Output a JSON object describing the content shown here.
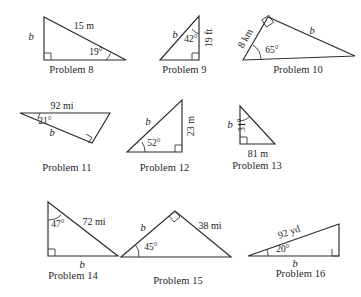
{
  "page": {
    "background_color": "#ffffff",
    "stroke_color": "#2b2b2b",
    "text_color": "#1b1b1b"
  },
  "problems": [
    {
      "id": "problem-8",
      "caption": "Problem 8",
      "unknown_label": "b",
      "side_label": "15 m",
      "angle_label": "19°",
      "has_right_angle": true,
      "right_angle_vertex": "bottom-left",
      "shape": "right triangle, vertical leg at left labeled b, hypotenuse 15 m sloping down to the right, 19 degree angle at the far right vertex"
    },
    {
      "id": "problem-9",
      "caption": "Problem 9",
      "unknown_label": "b",
      "side_label": "19 ft",
      "angle_label": "42°",
      "has_right_angle": true,
      "right_angle_vertex": "bottom-right",
      "shape": "right triangle, vertical leg at right labeled 19 ft, hypotenuse b from bottom-left to top-right, 42 degree angle at the top vertex"
    },
    {
      "id": "problem-10",
      "caption": "Problem 10",
      "unknown_label": "b",
      "side_label": "8 km",
      "angle_label": "65°",
      "has_right_angle": true,
      "right_angle_vertex": "apex",
      "shape": "right triangle, short side 8 km rising from bottom-left to apex, long side b from apex down to the right, 65 degree angle at bottom-left"
    },
    {
      "id": "problem-11",
      "caption": "Problem 11",
      "unknown_label": "b",
      "side_label": "92 mi",
      "angle_label": "21°",
      "has_right_angle": true,
      "right_angle_vertex": "right",
      "shape": "thin right triangle, top side 92 mi horizontal, side b sloping down from the far left vertex, 21 degree angle at the left vertex"
    },
    {
      "id": "problem-12",
      "caption": "Problem 12",
      "unknown_label": "b",
      "side_label": "23 m",
      "angle_label": "52°",
      "has_right_angle": true,
      "right_angle_vertex": "bottom-right",
      "shape": "right triangle, vertical leg at right labeled 23 m, hypotenuse b from bottom-left to top-right, 52 degree angle at bottom-left"
    },
    {
      "id": "problem-13",
      "caption": "Problem 13",
      "unknown_label": "b",
      "side_label": "81 m",
      "angle_label": "31°",
      "has_right_angle": true,
      "right_angle_vertex": "bottom-left",
      "shape": "right triangle, vertical leg at left labeled b, horizontal base 81 m, 31 degree angle at the top vertex"
    },
    {
      "id": "problem-14",
      "caption": "Problem 14",
      "unknown_label": "b",
      "side_label": "72 mi",
      "angle_label": "47°",
      "has_right_angle": true,
      "right_angle_vertex": "bottom-left",
      "shape": "right triangle, vertical leg at left, hypotenuse 72 mi from top-left to bottom-right, base labeled b, 47 degree angle at top-left"
    },
    {
      "id": "problem-15",
      "caption": "Problem 15",
      "unknown_label": "b",
      "side_label": "38 mi",
      "angle_label": "45°",
      "has_right_angle": true,
      "right_angle_vertex": "apex",
      "shape": "right triangle with apex at top, left side b, right side 38 mi, 45 degree angle at bottom-left"
    },
    {
      "id": "problem-16",
      "caption": "Problem 16",
      "unknown_label": "b",
      "side_label": "92 yd",
      "angle_label": "20°",
      "has_right_angle": true,
      "right_angle_vertex": "bottom-right",
      "shape": "thin right triangle, hypotenuse 92 yd from far left up to top-right, base labeled b, 20 degree angle at the left vertex"
    }
  ]
}
